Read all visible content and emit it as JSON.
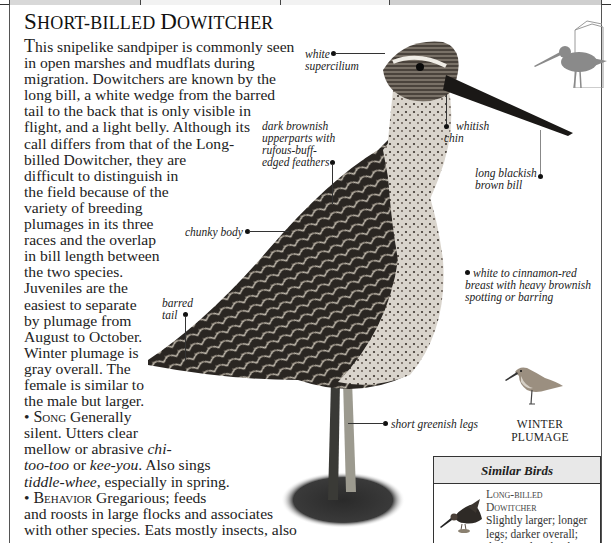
{
  "tabs": [
    {
      "label": "",
      "fill": "#d8d8d8"
    },
    {
      "label": "",
      "fill": "#f2f2f2"
    },
    {
      "label": "",
      "fill": "#f2f2f2"
    },
    {
      "label": "",
      "fill": "#cfcfcf"
    }
  ],
  "species": {
    "title_first_cap": "S",
    "title_rest_1": "hort-billed ",
    "title_second_cap": "D",
    "title_rest_2": "owitcher"
  },
  "description": {
    "dropcap": "T",
    "lines": [
      "his snipelike sandpiper is commonly seen",
      "in open marshes and mudflats during",
      "migration. Dowitchers are known by the",
      "long bill, a white wedge from the barred",
      "tail to the back that is only visible in",
      "flight, and a light belly. Although its",
      "call differs from that of the Long-",
      "billed Dowitcher, they are",
      "difficult to distinguish in",
      "the field because of the",
      "variety of breeding",
      "plumages in its three",
      "races and the overlap",
      "in bill length between",
      "the two species.",
      "Juveniles are the",
      "easiest to separate",
      "by plumage from",
      "August to October.",
      "Winter plumage is",
      "gray overall. The",
      "female is similar to",
      "the male but larger."
    ]
  },
  "song": {
    "bullet": "•",
    "heading": "Song",
    "line1": " Generally",
    "line2": "silent. Utters clear",
    "line3_pre": "mellow or abrasive ",
    "line3_em": "chi-",
    "line4_em1": "too-too",
    "line4_mid": " or ",
    "line4_em2": "kee-you",
    "line4_post": ". Also sings",
    "line5_em": "tiddle-whee",
    "line5_post": ", especially in spring."
  },
  "behavior": {
    "bullet": "•",
    "heading": "Behavior",
    "line1": " Gregarious; feeds",
    "line2": "and roosts in large flocks and associates",
    "line3": "with other species. Eats mostly insects, also"
  },
  "annotations": {
    "supercilium_1": "white",
    "supercilium_2": "supercilium",
    "upperparts_1": "dark brownish",
    "upperparts_2": "upperparts with",
    "upperparts_3": "rufous-buff-",
    "upperparts_4": "edged feathers",
    "chin_1": "whitish",
    "chin_2": "chin",
    "bill_1": "long blackish",
    "bill_2": "brown bill",
    "body": "chunky body",
    "breast_1": "white to cinnamon-red",
    "breast_2": "breast with heavy brownish",
    "breast_3": "spotting or barring",
    "tail_1": "barred",
    "tail_2": "tail",
    "legs": "short greenish legs"
  },
  "winter_plumage": {
    "line1": "Winter",
    "line2": "Plumage"
  },
  "similar_birds": {
    "heading": "Similar Birds",
    "items": [
      {
        "name_1": "Long-billed",
        "name_2": "Dowitcher",
        "desc_lines": [
          "Slightly larger; longer",
          "legs; darker overall;",
          "darker tail with white"
        ]
      }
    ]
  },
  "colors": {
    "silhouette": "#8a8a8a",
    "frame": "#555555",
    "box_header": "#e8e8e8"
  }
}
